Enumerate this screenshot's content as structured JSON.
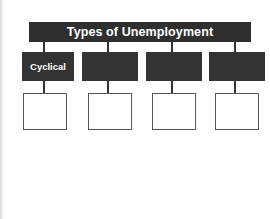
{
  "diagram": {
    "title": "Types of Unemployment",
    "categories": [
      {
        "label": "Cyclical"
      },
      {
        "label": ""
      },
      {
        "label": ""
      },
      {
        "label": ""
      }
    ],
    "answer_boxes": [
      {
        "text": ""
      },
      {
        "text": ""
      },
      {
        "text": ""
      },
      {
        "text": ""
      }
    ],
    "colors": {
      "box_fill": "#333333",
      "box_text": "#ffffff",
      "outline": "#555555",
      "background": "#ffffff"
    }
  }
}
